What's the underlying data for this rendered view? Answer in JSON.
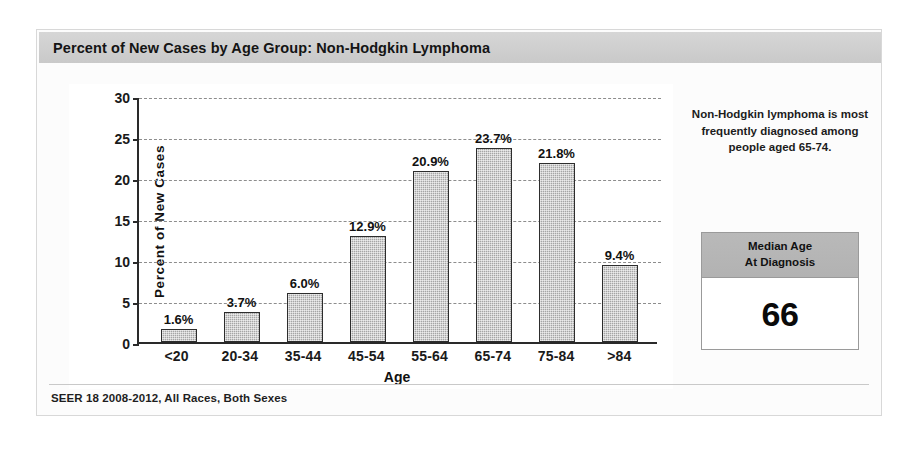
{
  "card": {
    "title": "Percent of New Cases by Age Group: Non-Hodgkin Lymphoma",
    "footer": "SEER 18 2008-2012, All Races, Both Sexes"
  },
  "side_panel": {
    "note": "Non-Hodgkin lymphoma is most frequently diagnosed among people aged 65-74.",
    "median_box": {
      "header_line1": "Median Age",
      "header_line2": "At Diagnosis",
      "value": "66"
    }
  },
  "chart_data": {
    "type": "bar",
    "title": "Percent of New Cases by Age Group: Non-Hodgkin Lymphoma",
    "xlabel": "Age",
    "ylabel": "Percent of New Cases",
    "categories": [
      "<20",
      "20-34",
      "35-44",
      "45-54",
      "55-64",
      "65-74",
      "75-84",
      ">84"
    ],
    "values": [
      1.6,
      3.7,
      6.0,
      12.9,
      20.9,
      23.7,
      21.8,
      9.4
    ],
    "data_labels": [
      "1.6%",
      "3.7%",
      "6.0%",
      "12.9%",
      "20.9%",
      "23.7%",
      "21.8%",
      "9.4%"
    ],
    "ylim": [
      0,
      30
    ],
    "yticks": [
      0,
      5,
      10,
      15,
      20,
      25,
      30
    ],
    "ytick_labels": [
      "0",
      "5",
      "10",
      "15",
      "20",
      "25",
      "30"
    ],
    "grid": true,
    "legend": false,
    "bar_color": "#a5a5a5",
    "bar_border_color": "#2d2d2d",
    "grid_color": "#8d8d8d"
  }
}
